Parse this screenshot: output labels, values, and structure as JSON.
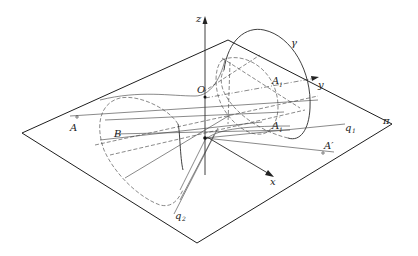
{
  "figure": {
    "labels": {
      "z_axis": "z",
      "y_axis": "y",
      "x_axis": "x",
      "gamma": "γ",
      "pi": "π",
      "A": "A",
      "B": "B",
      "A1": "A",
      "A1_sub": "1",
      "A1_prime": "A",
      "A1_prime_sub": "1",
      "A1_prime_mark": "′",
      "A_prime": "A′",
      "q1": "q",
      "q1_sub": "1",
      "q2": "q",
      "q2_sub": "2",
      "O": "O"
    },
    "colors": {
      "stroke": "#2a2a2a",
      "background": "#ffffff"
    }
  }
}
